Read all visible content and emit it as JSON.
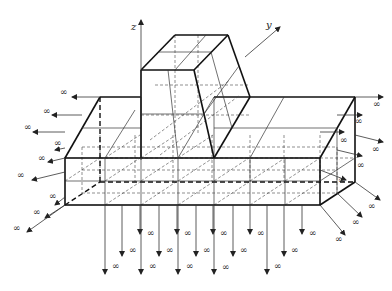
{
  "diagram": {
    "type": "3D finite/infinite element mesh diagram",
    "axes": {
      "z_label": "z",
      "y_label": "y"
    },
    "infinity_symbol": "∞",
    "colors": {
      "line": "#111111",
      "background": "#ffffff"
    },
    "groups": {
      "left_arrows": 9,
      "right_arrows": 9,
      "bottom_arrows": 15
    }
  }
}
